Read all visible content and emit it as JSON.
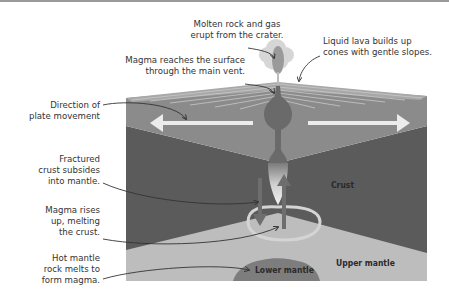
{
  "figure": {
    "annotations": {
      "molten_rock": "Molten rock and gas\nerupt from the crater.",
      "liquid_lava": "Liquid lava builds up\ncones with gentle slopes.",
      "magma_surface": "Magma reaches the surface\nthrough the main vent.",
      "plate_movement": "Direction of\nplate movement",
      "fractured_crust": "Fractured\ncrust subsides\ninto mantle.",
      "magma_rises": "Magma rises\nup, melting\nthe crust.",
      "hot_mantle": "Hot mantle\nrock melts to\nform magma."
    },
    "layers": {
      "crust": "Crust",
      "upper_mantle": "Upper mantle",
      "lower_mantle": "Lower mantle"
    },
    "colors": {
      "surface_top": "#a3a3a3",
      "surface_lines": "#c4c4c4",
      "upper_crust": "#8b8b8b",
      "lower_crust": "#5b5b5b",
      "upper_mantle": "#bdbdbd",
      "lower_mantle": "#7d7d7d",
      "magma": "#6a6a6a",
      "arrow_white": "#e6e6e6",
      "plume": "#cfcfcf",
      "leader_line": "#333333"
    }
  }
}
